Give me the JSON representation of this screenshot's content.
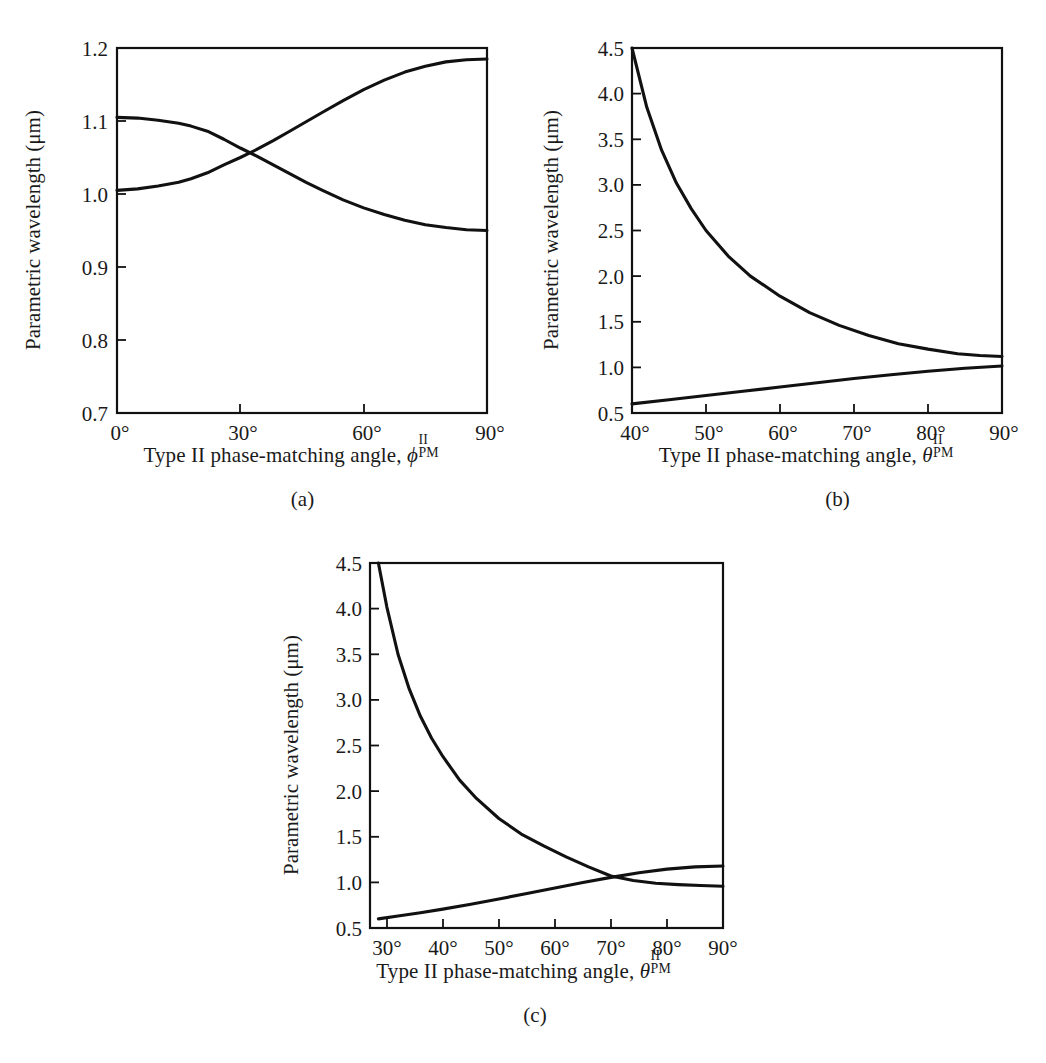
{
  "figure": {
    "background": "#ffffff",
    "ink_color": "#111111",
    "shared_ylabel": "Parametric wavelength (μm)",
    "degree_symbol": "°"
  },
  "panels": [
    {
      "id": "a",
      "caption": "(a)",
      "xlabel_prefix": "Type II phase-matching angle, ",
      "xlabel_symbol": "ϕ",
      "xlabel_superscript": "II",
      "xlabel_subscript": "PM",
      "ylabel": "Parametric wavelength (μm)",
      "xticks": [
        "0°",
        "30°",
        "60°",
        "90°"
      ],
      "yticks": [
        "0.7",
        "0.8",
        "0.9",
        "1.0",
        "1.1",
        "1.2"
      ]
    },
    {
      "id": "b",
      "caption": "(b)",
      "xlabel_prefix": "Type II phase-matching angle, ",
      "xlabel_symbol": "θ",
      "xlabel_superscript": "II",
      "xlabel_subscript": "PM",
      "ylabel": "Parametric wavelength (μm)",
      "xticks": [
        "40°",
        "50°",
        "60°",
        "70°",
        "80°",
        "90°"
      ],
      "yticks": [
        "0.5",
        "1.0",
        "1.5",
        "2.0",
        "2.5",
        "3.0",
        "3.5",
        "4.0",
        "4.5"
      ]
    },
    {
      "id": "c",
      "caption": "(c)",
      "xlabel_prefix": "Type II phase-matching angle, ",
      "xlabel_symbol": "θ",
      "xlabel_superscript": "II",
      "xlabel_subscript": "PM",
      "ylabel": "Parametric wavelength (μm)",
      "xticks": [
        "30°",
        "40°",
        "50°",
        "60°",
        "70°",
        "80°",
        "90°"
      ],
      "yticks": [
        "0.5",
        "1.0",
        "1.5",
        "2.0",
        "2.5",
        "3.0",
        "3.5",
        "4.0",
        "4.5"
      ]
    }
  ],
  "chart_data": [
    {
      "panel": "a",
      "type": "line",
      "title": "",
      "xlabel": "Type II phase-matching angle, phi^II_PM",
      "ylabel": "Parametric wavelength (μm)",
      "xlim": [
        0,
        90
      ],
      "ylim": [
        0.7,
        1.2
      ],
      "xtick_values": [
        0,
        30,
        60,
        90
      ],
      "ytick_values": [
        0.7,
        0.8,
        0.9,
        1.0,
        1.1,
        1.2
      ],
      "grid": false,
      "legend": "none",
      "crossing_point": {
        "x": 34,
        "y": 1.055
      },
      "series": [
        {
          "name": "signal-branch-descending",
          "x": [
            0,
            5,
            10,
            15,
            18,
            22,
            26,
            30,
            34,
            38,
            42,
            46,
            50,
            55,
            60,
            65,
            70,
            75,
            80,
            85,
            90
          ],
          "values": [
            1.105,
            1.104,
            1.101,
            1.097,
            1.093,
            1.086,
            1.075,
            1.063,
            1.052,
            1.04,
            1.028,
            1.016,
            1.005,
            0.992,
            0.981,
            0.972,
            0.964,
            0.958,
            0.954,
            0.951,
            0.95
          ]
        },
        {
          "name": "idler-branch-ascending",
          "x": [
            0,
            5,
            10,
            15,
            18,
            22,
            26,
            30,
            34,
            38,
            42,
            46,
            50,
            55,
            60,
            65,
            70,
            75,
            80,
            85,
            90
          ],
          "values": [
            1.005,
            1.007,
            1.011,
            1.016,
            1.021,
            1.029,
            1.04,
            1.05,
            1.061,
            1.073,
            1.086,
            1.099,
            1.112,
            1.128,
            1.143,
            1.156,
            1.167,
            1.175,
            1.181,
            1.184,
            1.185
          ]
        }
      ]
    },
    {
      "panel": "b",
      "type": "line",
      "title": "",
      "xlabel": "Type II phase-matching angle, theta^II_PM",
      "ylabel": "Parametric wavelength (μm)",
      "xlim": [
        40,
        90
      ],
      "ylim": [
        0.5,
        4.5
      ],
      "xtick_values": [
        40,
        50,
        60,
        70,
        80,
        90
      ],
      "ytick_values": [
        0.5,
        1.0,
        1.5,
        2.0,
        2.5,
        3.0,
        3.5,
        4.0,
        4.5
      ],
      "grid": false,
      "legend": "none",
      "series": [
        {
          "name": "idler-branch-descending",
          "x": [
            40,
            42,
            44,
            46,
            48,
            50,
            53,
            56,
            60,
            64,
            68,
            72,
            76,
            80,
            84,
            87,
            90
          ],
          "values": [
            4.5,
            3.85,
            3.38,
            3.02,
            2.74,
            2.5,
            2.22,
            2.0,
            1.78,
            1.6,
            1.46,
            1.35,
            1.26,
            1.2,
            1.15,
            1.13,
            1.12
          ]
        },
        {
          "name": "signal-branch-ascending",
          "x": [
            40,
            45,
            50,
            55,
            60,
            65,
            70,
            75,
            80,
            85,
            90
          ],
          "values": [
            0.6,
            0.645,
            0.692,
            0.738,
            0.785,
            0.832,
            0.878,
            0.92,
            0.957,
            0.99,
            1.015
          ]
        }
      ]
    },
    {
      "panel": "c",
      "type": "line",
      "title": "",
      "xlabel": "Type II phase-matching angle, theta^II_PM",
      "ylabel": "Parametric wavelength (μm)",
      "xlim": [
        27,
        90
      ],
      "ylim": [
        0.5,
        4.5
      ],
      "xtick_values": [
        30,
        40,
        50,
        60,
        70,
        80,
        90
      ],
      "ytick_values": [
        0.5,
        1.0,
        1.5,
        2.0,
        2.5,
        3.0,
        3.5,
        4.0,
        4.5
      ],
      "grid": false,
      "legend": "none",
      "crossing_point": {
        "x": 70,
        "y": 1.06
      },
      "series": [
        {
          "name": "idler-branch-descending",
          "x": [
            28.5,
            30,
            32,
            34,
            36,
            38,
            40,
            43,
            46,
            50,
            54,
            58,
            62,
            66,
            70,
            74,
            78,
            82,
            86,
            90
          ],
          "values": [
            4.5,
            4.02,
            3.5,
            3.12,
            2.82,
            2.58,
            2.38,
            2.12,
            1.92,
            1.7,
            1.53,
            1.4,
            1.28,
            1.17,
            1.07,
            1.02,
            0.99,
            0.975,
            0.965,
            0.958
          ]
        },
        {
          "name": "signal-branch-ascending",
          "x": [
            28.5,
            32,
            36,
            40,
            45,
            50,
            55,
            60,
            65,
            70,
            75,
            80,
            85,
            90
          ],
          "values": [
            0.6,
            0.632,
            0.668,
            0.707,
            0.76,
            0.818,
            0.878,
            0.938,
            0.998,
            1.055,
            1.105,
            1.145,
            1.17,
            1.18
          ]
        }
      ]
    }
  ]
}
